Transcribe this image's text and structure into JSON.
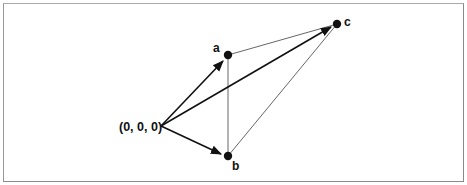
{
  "diagram": {
    "type": "vector-diagram",
    "origin": {
      "label": "(0, 0, 0)",
      "x": 160,
      "y": 126
    },
    "points": [
      {
        "id": "a",
        "label": "a",
        "x": 228,
        "y": 55
      },
      {
        "id": "b",
        "label": "b",
        "x": 228,
        "y": 156
      },
      {
        "id": "c",
        "label": "c",
        "x": 337,
        "y": 24
      }
    ],
    "vectors": [
      {
        "from": "origin",
        "to": "a",
        "style": "bold-arrow"
      },
      {
        "from": "origin",
        "to": "b",
        "style": "bold-arrow"
      },
      {
        "from": "origin",
        "to": "c",
        "style": "bold-arrow"
      }
    ],
    "edges": [
      {
        "from": "a",
        "to": "b",
        "style": "thin"
      },
      {
        "from": "a",
        "to": "c",
        "style": "thin"
      },
      {
        "from": "b",
        "to": "c",
        "style": "thin"
      }
    ],
    "colors": {
      "stroke": "#111111",
      "thin": "#444444",
      "border": "#8a8a8a"
    }
  }
}
